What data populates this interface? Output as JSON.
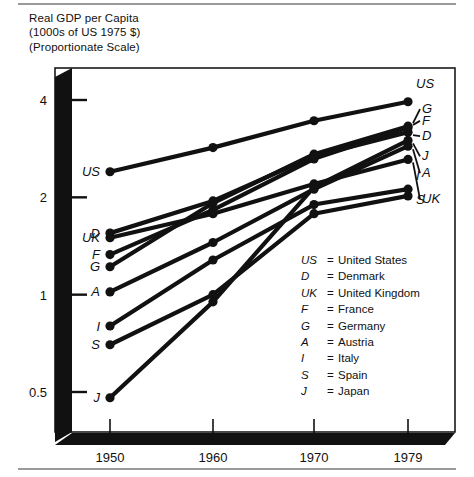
{
  "title": "Real GDP per Capita\n(1000s of US 1975 $)\n(Proportionate Scale)",
  "legend": {
    "entries": [
      {
        "key": "US",
        "eq": "=",
        "name": "United States"
      },
      {
        "key": "D",
        "eq": "=",
        "name": "Denmark"
      },
      {
        "key": "UK",
        "eq": "=",
        "name": "United Kingdom"
      },
      {
        "key": "F",
        "eq": "=",
        "name": "France"
      },
      {
        "key": "G",
        "eq": "=",
        "name": "Germany"
      },
      {
        "key": "A",
        "eq": "=",
        "name": "Austria"
      },
      {
        "key": "I",
        "eq": "=",
        "name": "Italy"
      },
      {
        "key": "S",
        "eq": "=",
        "name": "Spain"
      },
      {
        "key": "J",
        "eq": "=",
        "name": "Japan"
      }
    ]
  },
  "chart_data": {
    "type": "line",
    "title": "Real GDP per Capita (1000s of US 1975 $) (Proportionate Scale)",
    "xlabel": "",
    "ylabel": "Real GDP per Capita (1000s of US 1975 $)",
    "x": [
      1950,
      1960,
      1970,
      1979
    ],
    "xtick_labels": [
      "1950",
      "1960",
      "1970",
      "1979"
    ],
    "ytick_labels": [
      "4",
      "2",
      "1",
      "0.5"
    ],
    "ytick_values": [
      4,
      2,
      1,
      0.5
    ],
    "yscale": "log",
    "ylim": [
      0.42,
      4.6
    ],
    "grid": false,
    "legend_position": "inside-lower-right",
    "left_labels": [
      "US",
      "D",
      "UK",
      "F",
      "G",
      "A",
      "I",
      "S",
      "J"
    ],
    "right_labels": [
      "US",
      "G",
      "F",
      "D",
      "J",
      "A",
      "UK",
      "I",
      "S"
    ],
    "series": [
      {
        "name": "US",
        "label": "United States",
        "values": [
          2.4,
          2.85,
          3.45,
          3.95
        ]
      },
      {
        "name": "G",
        "label": "Germany",
        "values": [
          1.22,
          1.92,
          2.72,
          3.32
        ]
      },
      {
        "name": "F",
        "label": "France",
        "values": [
          1.33,
          1.83,
          2.63,
          3.28
        ]
      },
      {
        "name": "D",
        "label": "Denmark",
        "values": [
          1.55,
          1.95,
          2.68,
          3.18
        ]
      },
      {
        "name": "J",
        "label": "Japan",
        "values": [
          0.48,
          0.95,
          2.15,
          3.0
        ]
      },
      {
        "name": "A",
        "label": "Austria",
        "values": [
          1.02,
          1.45,
          2.12,
          2.88
        ]
      },
      {
        "name": "UK",
        "label": "United Kingdom",
        "values": [
          1.5,
          1.78,
          2.2,
          2.62
        ]
      },
      {
        "name": "I",
        "label": "Italy",
        "values": [
          0.8,
          1.28,
          1.9,
          2.12
        ]
      },
      {
        "name": "S",
        "label": "Spain",
        "values": [
          0.7,
          1.0,
          1.78,
          2.02
        ]
      }
    ]
  }
}
